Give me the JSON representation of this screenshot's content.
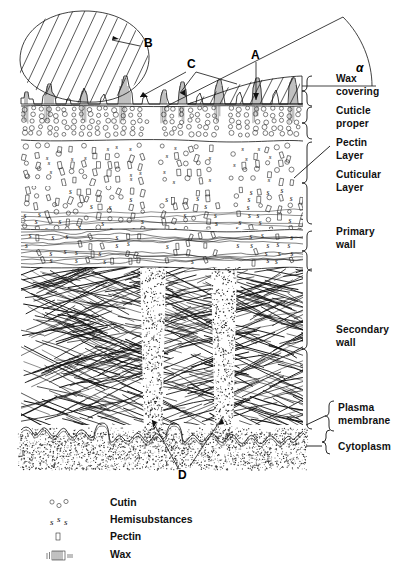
{
  "figure": {
    "background_color": "#ffffff",
    "ink_color": "#111111"
  },
  "callouts": [
    {
      "id": "A",
      "label": "A",
      "x": 253,
      "y": 56,
      "points_to": "wax-covering-layer"
    },
    {
      "id": "B",
      "label": "B",
      "x": 144,
      "y": 43,
      "points_to": "wax-plate-crystal"
    },
    {
      "id": "C",
      "label": "C",
      "x": 190,
      "y": 66,
      "points_to": "wax-rods-projections"
    },
    {
      "id": "D",
      "label": "D",
      "x": 181,
      "y": 472,
      "points_to": "pore-canal-channels"
    },
    {
      "id": "alpha",
      "label": "α",
      "x": 363,
      "y": 66,
      "points_to": "contact-angle"
    }
  ],
  "layer_labels": [
    {
      "id": "wax-covering",
      "lines": [
        "Wax",
        "covering"
      ],
      "x": 336,
      "y": 80,
      "bracket": {
        "top": 76,
        "bottom": 104
      }
    },
    {
      "id": "cuticle-proper",
      "lines": [
        "Cuticle",
        "proper"
      ],
      "x": 336,
      "y": 114,
      "bracket": {
        "top": 106,
        "bottom": 140
      }
    },
    {
      "id": "pectin-layer",
      "lines": [
        "Pectin",
        "Layer"
      ],
      "x": 336,
      "y": 148,
      "bracket": null
    },
    {
      "id": "cuticular-layer",
      "lines": [
        "Cuticular",
        "Layer"
      ],
      "x": 336,
      "y": 182,
      "bracket": {
        "top": 142,
        "bottom": 228
      }
    },
    {
      "id": "primary-wall",
      "lines": [
        "Primary",
        "wall"
      ],
      "x": 336,
      "y": 233,
      "bracket": {
        "top": 230,
        "bottom": 266
      }
    },
    {
      "id": "secondary-wall",
      "lines": [
        "Secondary",
        "wall"
      ],
      "x": 336,
      "y": 330,
      "bracket": {
        "top": 268,
        "bottom": 424
      }
    },
    {
      "id": "plasma-membrane",
      "lines": [
        "Plasma",
        "membrane"
      ],
      "x": 338,
      "y": 407,
      "bracket": {
        "top": 404,
        "bottom": 428
      }
    },
    {
      "id": "cytoplasm",
      "lines": [
        "Cytoplasm"
      ],
      "x": 338,
      "y": 441,
      "bracket": {
        "top": 432,
        "bottom": 452
      }
    }
  ],
  "legend": {
    "items": [
      {
        "symbol": "cutin-circles-symbol",
        "label": "Cutin",
        "y": 505
      },
      {
        "symbol": "hemisubstances-s-symbol",
        "label": "Hemisubstances",
        "y": 522
      },
      {
        "symbol": "pectin-rectangle-symbol",
        "label": "Pectin",
        "y": 539
      },
      {
        "symbol": "wax-hatch-symbol",
        "label": "Wax",
        "y": 556
      }
    ],
    "label_x": 110,
    "symbol_x": 58
  },
  "regions": [
    {
      "id": "wax-covering-layer",
      "top": 76,
      "bottom": 104,
      "texture": "hatched-plates-and-rods"
    },
    {
      "id": "cuticle-proper-layer",
      "top": 106,
      "bottom": 140,
      "texture": "cutin-circles"
    },
    {
      "id": "pectin-layer-region",
      "top": 142,
      "bottom": 185,
      "texture": "pectin-rectangles-and-cutin"
    },
    {
      "id": "cuticular-layer-region",
      "top": 185,
      "bottom": 228,
      "texture": "pectin-hemisubstances-mixed"
    },
    {
      "id": "primary-wall-region",
      "top": 230,
      "bottom": 266,
      "texture": "wavy-fibrils-with-pectin"
    },
    {
      "id": "secondary-wall-region",
      "top": 268,
      "bottom": 424,
      "texture": "crisscross-microfibrils"
    },
    {
      "id": "plasma-membrane-region",
      "top": 424,
      "bottom": 440,
      "texture": "undulating-double-line"
    },
    {
      "id": "cytoplasm-region",
      "top": 440,
      "bottom": 470,
      "texture": "stippled"
    }
  ],
  "pore_canals": [
    {
      "id": "pore-canal-left",
      "cx": 153,
      "top": 268,
      "bottom": 440
    },
    {
      "id": "pore-canal-right",
      "cx": 224,
      "top": 268,
      "bottom": 440
    }
  ],
  "diagram_bounds": {
    "left": 21,
    "right": 303,
    "top": 76,
    "bottom": 470
  }
}
